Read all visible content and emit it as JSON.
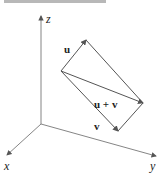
{
  "figure": {
    "axes": {
      "x_label": "x",
      "y_label": "y",
      "z_label": "z"
    },
    "vectors": [
      {
        "label": "u"
      },
      {
        "label": "v"
      },
      {
        "label": "u + v"
      }
    ],
    "colors": {
      "line": "#555555",
      "text": "#222222",
      "topbar": "#b8b8b8"
    }
  }
}
